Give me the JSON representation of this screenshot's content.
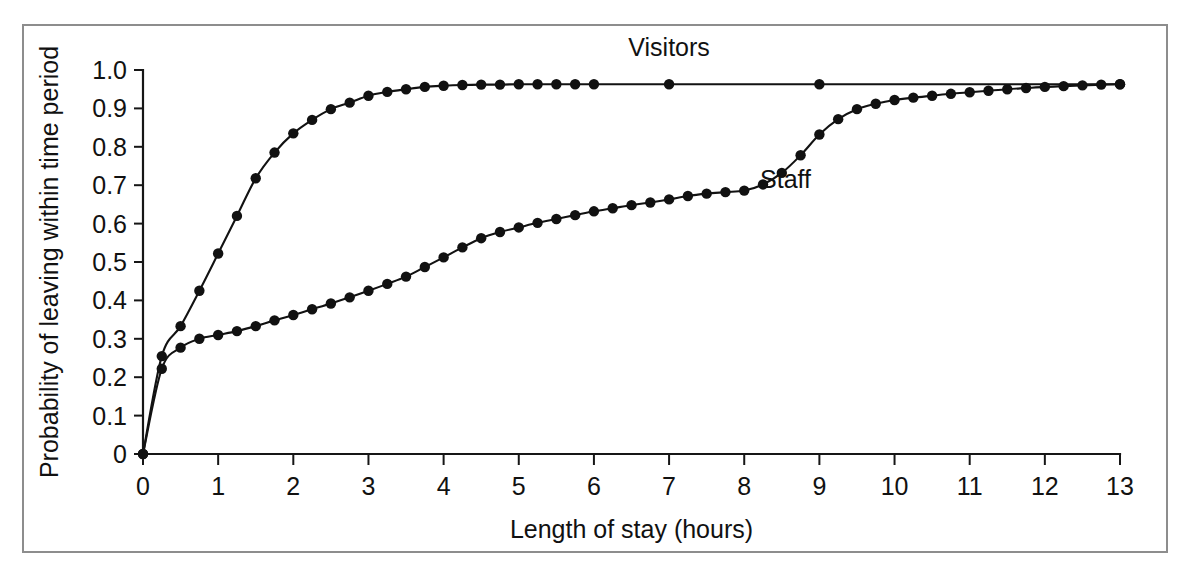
{
  "figure": {
    "caption": "",
    "background_color": "#ffffff",
    "frame_color": "#8d8d8d",
    "ink_color": "#111111"
  },
  "chart_data": {
    "type": "line",
    "title": "",
    "subtitle": "",
    "xlabel": "Length of stay (hours)",
    "ylabel": "Probability of leaving within time period",
    "xlim": [
      0,
      13
    ],
    "ylim": [
      0,
      1.0
    ],
    "xticks": [
      0,
      1,
      2,
      3,
      4,
      5,
      6,
      7,
      8,
      9,
      10,
      11,
      12,
      13
    ],
    "xtick_labels": [
      "0",
      "1",
      "2",
      "3",
      "4",
      "5",
      "6",
      "7",
      "8",
      "9",
      "10",
      "11",
      "12",
      "13"
    ],
    "yticks": [
      0,
      0.1,
      0.2,
      0.3,
      0.4,
      0.5,
      0.6,
      0.7,
      0.8,
      0.9,
      1.0
    ],
    "ytick_labels": [
      "0",
      "0.1",
      "0.2",
      "0.3",
      "0.4",
      "0.5",
      "0.6",
      "0.7",
      "0.8",
      "0.9",
      "1.0"
    ],
    "grid": false,
    "legend_position": "inline-annotation",
    "marker": "filled-circle",
    "series": [
      {
        "name": "Visitors",
        "label": "Visitors",
        "label_x": 7.0,
        "label_y": 1.0,
        "x": [
          0,
          0.25,
          0.5,
          0.75,
          1.0,
          1.25,
          1.5,
          1.75,
          2.0,
          2.25,
          2.5,
          2.75,
          3.0,
          3.25,
          3.5,
          3.75,
          4.0,
          4.25,
          4.5,
          4.75,
          5.0,
          5.25,
          5.5,
          5.75,
          6.0,
          7.0,
          9.0,
          13.0
        ],
        "y": [
          0,
          0.255,
          0.333,
          0.425,
          0.522,
          0.62,
          0.718,
          0.785,
          0.835,
          0.87,
          0.898,
          0.915,
          0.933,
          0.943,
          0.95,
          0.956,
          0.959,
          0.961,
          0.962,
          0.962,
          0.963,
          0.963,
          0.963,
          0.963,
          0.963,
          0.963,
          0.963,
          0.963
        ]
      },
      {
        "name": "Staff",
        "label": "Staff",
        "label_x": 8.55,
        "label_y": 0.655,
        "x": [
          0,
          0.25,
          0.5,
          0.75,
          1.0,
          1.25,
          1.5,
          1.75,
          2.0,
          2.25,
          2.5,
          2.75,
          3.0,
          3.25,
          3.5,
          3.75,
          4.0,
          4.25,
          4.5,
          4.75,
          5.0,
          5.25,
          5.5,
          5.75,
          6.0,
          6.25,
          6.5,
          6.75,
          7.0,
          7.25,
          7.5,
          7.75,
          8.0,
          8.25,
          8.5,
          8.75,
          9.0,
          9.25,
          9.5,
          9.75,
          10.0,
          10.25,
          10.5,
          10.75,
          11.0,
          11.25,
          11.5,
          11.75,
          12.0,
          12.25,
          12.5,
          12.75,
          13.0
        ],
        "y": [
          0,
          0.222,
          0.277,
          0.3,
          0.31,
          0.32,
          0.333,
          0.348,
          0.362,
          0.377,
          0.392,
          0.408,
          0.425,
          0.443,
          0.462,
          0.487,
          0.512,
          0.538,
          0.562,
          0.578,
          0.59,
          0.602,
          0.612,
          0.622,
          0.632,
          0.64,
          0.648,
          0.655,
          0.663,
          0.672,
          0.678,
          0.682,
          0.686,
          0.702,
          0.732,
          0.778,
          0.832,
          0.872,
          0.898,
          0.912,
          0.922,
          0.928,
          0.933,
          0.938,
          0.942,
          0.946,
          0.95,
          0.953,
          0.956,
          0.958,
          0.96,
          0.962,
          0.963
        ]
      }
    ]
  }
}
